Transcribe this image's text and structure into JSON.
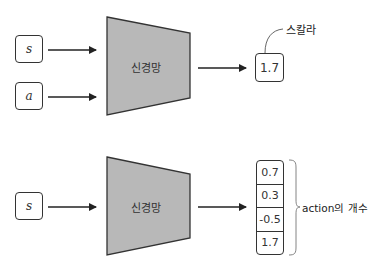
{
  "diagrams": {
    "top": {
      "inputs": [
        "s",
        "a"
      ],
      "network_label": "신경망",
      "output_value": "1.7",
      "output_annotation": "스칼라"
    },
    "bottom": {
      "inputs": [
        "s"
      ],
      "network_label": "신경망",
      "output_values": [
        "0.7",
        "0.3",
        "-0.5",
        "1.7"
      ],
      "output_annotation": "action의 개수"
    }
  },
  "colors": {
    "network_fill": "#b8b8b8",
    "stroke": "#333333"
  }
}
